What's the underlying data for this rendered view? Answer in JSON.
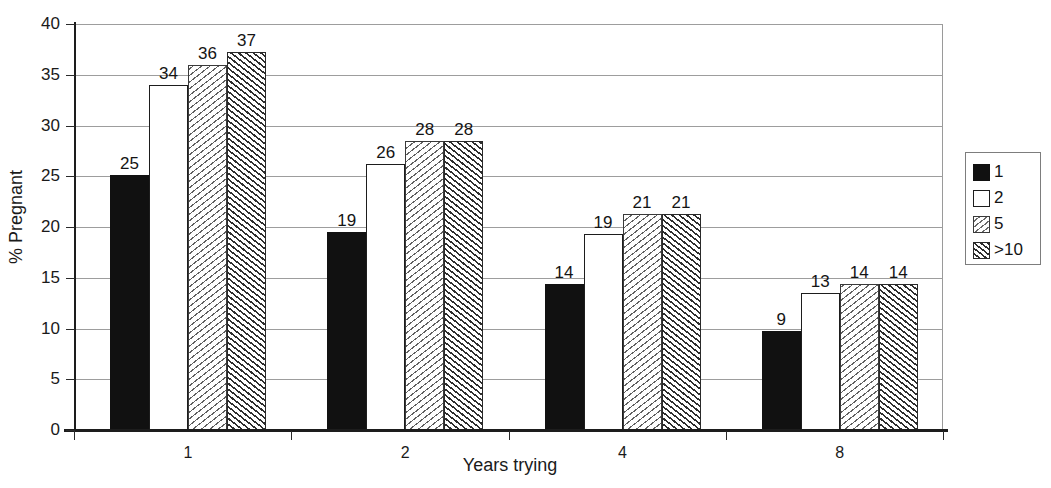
{
  "chart_data": {
    "type": "bar",
    "title": "",
    "xlabel": "Years trying",
    "ylabel": "% Pregnant",
    "categories": [
      "1",
      "2",
      "4",
      "8"
    ],
    "series": [
      {
        "name": "1",
        "pattern": "solid-black",
        "values": [
          25,
          19,
          14,
          9
        ]
      },
      {
        "name": "2",
        "pattern": "white-outline",
        "values": [
          34,
          26,
          19,
          13
        ]
      },
      {
        "name": "5",
        "pattern": "light-diagonal-hatch",
        "values": [
          36,
          28,
          21,
          14
        ]
      },
      {
        "name": ">10",
        "pattern": "dark-diagonal-hatch",
        "values": [
          37,
          28,
          21,
          14
        ]
      }
    ],
    "ylim": [
      0,
      40
    ],
    "ytick_step": 5,
    "yticks": [
      0,
      5,
      10,
      15,
      20,
      25,
      30,
      35,
      40
    ],
    "ytick_labels": [
      "0",
      "5",
      "10",
      "15",
      "20",
      "25",
      "30",
      "35",
      "40"
    ],
    "grid": true,
    "grid_axis": "y",
    "legend_position": "right-outside",
    "legend_title": "",
    "data_labels": true
  },
  "legend": {
    "entries": [
      {
        "label": "1",
        "swatch": "solid-black"
      },
      {
        "label": "2",
        "swatch": "white-outline"
      },
      {
        "label": "5",
        "swatch": "light-diagonal-hatch"
      },
      {
        "label": ">10",
        "swatch": "dark-diagonal-hatch"
      }
    ]
  },
  "axes": {
    "y_title": "% Pregnant",
    "x_title": "Years trying"
  }
}
